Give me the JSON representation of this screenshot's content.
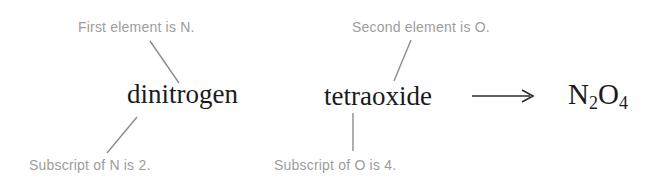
{
  "diagram": {
    "title_text": "Naming breakdown of dinitrogen tetraoxide",
    "colors": {
      "background": "#ffffff",
      "annotation_text": "#9d9d9d",
      "main_text": "#1b1b1b",
      "leader_line": "#8c8c8c",
      "arrow": "#2b2b2b"
    },
    "annotations": {
      "first_element": "First element is N.",
      "second_element": "Second element is O.",
      "subscript_n": "Subscript of N is 2.",
      "subscript_o": "Subscript of O is 4."
    },
    "terms": {
      "prefix_word": "dinitrogen",
      "suffix_word": "tetraoxide"
    },
    "arrow": {
      "glyph": "long-rightwards-arrow",
      "symbol": "⟶"
    },
    "product": {
      "element_one": "N",
      "subscript_one": "2",
      "element_two": "O",
      "subscript_two": "4",
      "full": "N2O4"
    }
  }
}
